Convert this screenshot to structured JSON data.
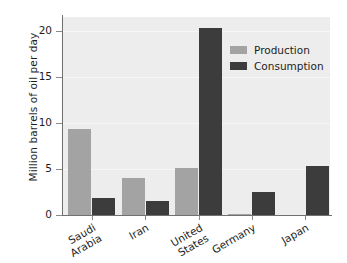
{
  "chart_data": {
    "type": "bar",
    "title": "",
    "xlabel": "",
    "ylabel": "Million barrels of oil per day",
    "categories": [
      "Saudi Arabia",
      "Iran",
      "United States",
      "Germany",
      "Japan"
    ],
    "category_lines": [
      [
        "Saudi",
        "Arabia"
      ],
      [
        "Iran"
      ],
      [
        "United",
        "States"
      ],
      [
        "Germany"
      ],
      [
        "Japan"
      ]
    ],
    "series": [
      {
        "name": "Production",
        "color": "#a3a3a3",
        "values": [
          9.3,
          4.0,
          5.1,
          0.15,
          0.05
        ]
      },
      {
        "name": "Consumption",
        "color": "#3c3c3c",
        "values": [
          1.8,
          1.5,
          20.3,
          2.5,
          5.3
        ]
      }
    ],
    "ylim": [
      0,
      21.5
    ],
    "yticks": [
      0,
      5,
      10,
      15,
      20
    ],
    "ytick_labels": [
      "0",
      "5",
      "10",
      "15",
      "20"
    ],
    "grid": true,
    "legend_position": "upper right",
    "plot_background": "#ededed",
    "figure_background": "#ffffff"
  }
}
